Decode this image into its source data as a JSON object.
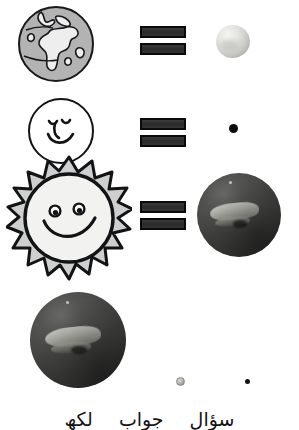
{
  "page": {
    "background_color": "#ffffff"
  },
  "rows": [
    {
      "id": "row-earth",
      "left_label": "earth-globe",
      "operator": "=",
      "right_label": "small-white-sphere"
    },
    {
      "id": "row-face",
      "left_label": "smiley-face-circle",
      "operator": "=",
      "right_label": "tiny-black-dot"
    },
    {
      "id": "row-sun",
      "left_label": "sun-with-face",
      "operator": "=",
      "right_label": "large-dark-sphere"
    }
  ],
  "bottom_row": {
    "id": "row-bottom",
    "items": [
      "large-dark-sphere",
      "small-gray-circle",
      "tiny-black-dot"
    ]
  },
  "caption": {
    "visible": true,
    "note": "handwritten script, clipped by bottom image edge",
    "segments": [
      "سؤال",
      "جواب",
      "لکھ"
    ]
  },
  "colors": {
    "ink": "#121315",
    "earth_fill": "#b3b3b3",
    "sun_ray_fill": "#cfcfcf",
    "sun_face_fill": "#f2f2f0",
    "sphere_dark": "#3a3a39",
    "sphere_light": "#e3e3df",
    "equals_bar": "#2c2c2c"
  }
}
